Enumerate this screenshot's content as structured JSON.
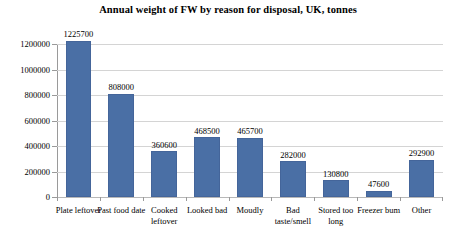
{
  "chart_data": {
    "type": "bar",
    "title": "Annual weight of FW by reason for disposal, UK, tonnes",
    "xlabel": "",
    "ylabel": "",
    "ylim": [
      0,
      1200000
    ],
    "ytick_values": [
      0,
      200000,
      400000,
      600000,
      800000,
      1000000,
      1200000
    ],
    "ytick_labels": [
      "0",
      "200000",
      "400000",
      "600000",
      "800000",
      "1000000",
      "1200000"
    ],
    "grid": true,
    "legend": false,
    "bar_color": "#4a6fa5",
    "gridline_color": "#d4d4d4",
    "axis_color": "#9a9a9a",
    "categories": [
      "Plate leftover",
      "Past food date",
      "Cooked leftover",
      "Looked bad",
      "Moudly",
      "Bad taste/smell",
      "Stored too long",
      "Freezer bum",
      "Other"
    ],
    "values": [
      1225700,
      808000,
      360600,
      468500,
      465700,
      282000,
      130800,
      47600,
      292900
    ],
    "value_labels": [
      "1225700",
      "808000",
      "360600",
      "468500",
      "465700",
      "282000",
      "130800",
      "47600",
      "292900"
    ]
  }
}
